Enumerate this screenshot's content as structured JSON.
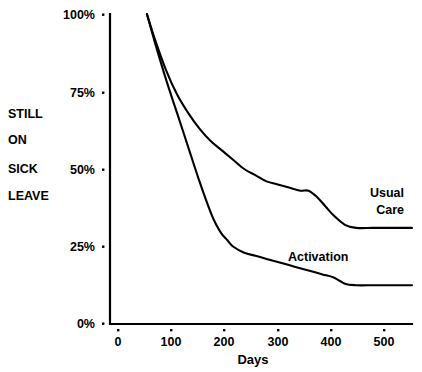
{
  "chart_data": {
    "type": "line",
    "title": "",
    "xlabel": "Days",
    "ylabel": "STILL ON SICK LEAVE",
    "ylabel_lines": [
      "STILL",
      "ON",
      "SICK",
      "LEAVE"
    ],
    "xlim": [
      0,
      540
    ],
    "ylim": [
      0,
      100
    ],
    "grid": false,
    "legend_position": "inline-annotations",
    "x_ticks": [
      0,
      100,
      200,
      300,
      400,
      500
    ],
    "x_tick_labels": [
      "0",
      "100",
      "200",
      "300",
      "400",
      "500"
    ],
    "y_ticks": [
      0,
      25,
      50,
      75,
      100
    ],
    "y_tick_labels": [
      "0%",
      "25%",
      "50%",
      "75%",
      "100%"
    ],
    "series": [
      {
        "name": "Usual Care",
        "label": "Usual Care",
        "label_lines": [
          "Usual",
          "Care"
        ],
        "color": "#000000",
        "x": [
          66,
          80,
          100,
          120,
          140,
          160,
          180,
          200,
          220,
          240,
          260,
          280,
          300,
          320,
          340,
          355,
          370,
          385,
          400,
          420,
          440,
          470,
          500,
          540
        ],
        "y": [
          100,
          92,
          82,
          74,
          68,
          63,
          59,
          56,
          53,
          50,
          48,
          46,
          45,
          44,
          43,
          43,
          41,
          38,
          35,
          32,
          31,
          31,
          31,
          31
        ]
      },
      {
        "name": "Activation",
        "label": "Activation",
        "label_lines": [
          "Activation"
        ],
        "color": "#000000",
        "x": [
          66,
          80,
          100,
          120,
          140,
          160,
          180,
          190,
          200,
          210,
          220,
          240,
          260,
          280,
          300,
          320,
          340,
          360,
          380,
          400,
          420,
          440,
          470,
          500,
          540
        ],
        "y": [
          100,
          91,
          79,
          68,
          57,
          46,
          36,
          32,
          29,
          27,
          25,
          23,
          22,
          21,
          20,
          19,
          18,
          17,
          16,
          15,
          13,
          12.5,
          12.5,
          12.5,
          12.5
        ]
      }
    ],
    "annotations": [
      {
        "text": "Usual Care",
        "x_px": 404,
        "y_px": 196,
        "anchor": "end"
      },
      {
        "text": "Activation",
        "x_px": 288,
        "y_px": 260,
        "anchor": "start"
      }
    ]
  },
  "geometry": {
    "plot_left": 110,
    "plot_right": 412,
    "plot_top": 14,
    "plot_bottom": 324,
    "x_px_per_day": 0.5315,
    "y_px_per_percent": 3.1
  }
}
